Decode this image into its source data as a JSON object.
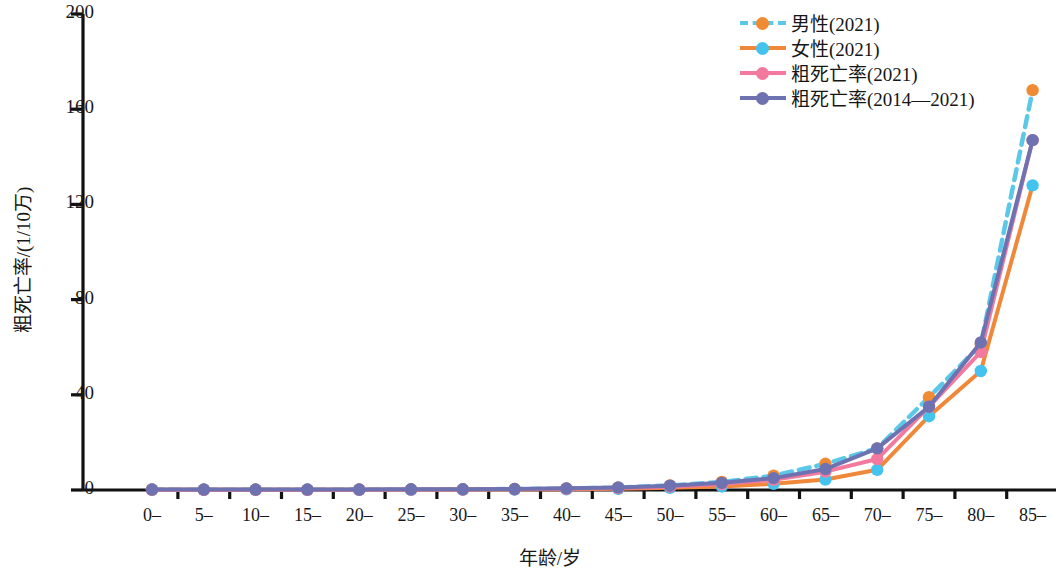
{
  "chart_data": {
    "type": "line",
    "title": "",
    "xlabel": "年龄/岁",
    "ylabel": "粗死亡率/(1/10万)",
    "ylim": [
      0,
      200
    ],
    "yticks": [
      0,
      40,
      80,
      120,
      160,
      200
    ],
    "grid": false,
    "legend_position": "top-right",
    "categories": [
      "0–",
      "5–",
      "10–",
      "15–",
      "20–",
      "25–",
      "30–",
      "35–",
      "40–",
      "45–",
      "50–",
      "55–",
      "60–",
      "65–",
      "70–",
      "75–",
      "80–",
      "85–"
    ],
    "series": [
      {
        "name": "男性(2021)",
        "color": "#5bc8e8",
        "marker_color": "#f08a33",
        "line_style": "dashed",
        "values": [
          0.2,
          0.1,
          0.1,
          0.1,
          0.2,
          0.2,
          0.3,
          0.4,
          0.6,
          1.0,
          1.9,
          3.4,
          6.0,
          11.0,
          17.5,
          39.0,
          61.0,
          168.0
        ]
      },
      {
        "name": "女性(2021)",
        "color": "#f0883a",
        "marker_color": "#45c3ef",
        "line_style": "solid",
        "values": [
          0.1,
          0.1,
          0.1,
          0.1,
          0.1,
          0.1,
          0.2,
          0.2,
          0.3,
          0.5,
          0.9,
          1.5,
          2.6,
          4.4,
          8.5,
          31.0,
          50.0,
          128.0
        ]
      },
      {
        "name": "粗死亡率(2021)",
        "color": "#f4799e",
        "marker_color": "#f4799e",
        "line_style": "solid",
        "values": [
          0.1,
          0.1,
          0.1,
          0.1,
          0.1,
          0.2,
          0.2,
          0.3,
          0.5,
          0.8,
          1.4,
          2.5,
          4.3,
          7.7,
          13.0,
          35.0,
          58.0,
          147.0
        ]
      },
      {
        "name": "粗死亡率(2014—2021)",
        "color": "#6f72b0",
        "marker_color": "#6f72b0",
        "line_style": "solid",
        "values": [
          0.2,
          0.2,
          0.2,
          0.2,
          0.2,
          0.3,
          0.3,
          0.4,
          0.7,
          1.1,
          1.8,
          3.0,
          5.0,
          8.8,
          17.5,
          35.0,
          62.0,
          147.0
        ]
      }
    ]
  },
  "axes": {
    "x_title": "年龄/岁",
    "y_title": "粗死亡率/(1/10万)"
  },
  "legend": {
    "items": [
      {
        "label": "男性(2021)"
      },
      {
        "label": "女性(2021)"
      },
      {
        "label": "粗死亡率(2021)"
      },
      {
        "label": "粗死亡率(2014—2021)"
      }
    ]
  }
}
